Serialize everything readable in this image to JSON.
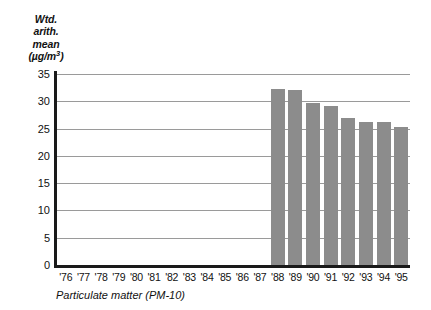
{
  "chart_data": {
    "type": "bar",
    "title": "",
    "subtitle": "",
    "ylabel_lines": [
      "Wtd.",
      "arith.",
      "mean"
    ],
    "ylabel_unit_prefix": "(µg/m",
    "ylabel_unit_exponent": "3",
    "ylabel_unit_suffix": ")",
    "ylabel_full": "Wtd. arith. mean (µg/m3)",
    "xlabel": "",
    "caption": "Particulate matter (PM-10)",
    "categories": [
      "'76",
      "'77",
      "'78",
      "'79",
      "'80",
      "'81",
      "'82",
      "'83",
      "'84",
      "'85",
      "'86",
      "'87",
      "'88",
      "'89",
      "'90",
      "'91",
      "'92",
      "'93",
      "'94",
      "'95"
    ],
    "values": [
      null,
      null,
      null,
      null,
      null,
      null,
      null,
      null,
      null,
      null,
      null,
      null,
      32.3,
      32.1,
      29.7,
      29.2,
      27.0,
      26.2,
      26.2,
      25.2
    ],
    "ylim": [
      0,
      35
    ],
    "yticks": [
      0,
      5,
      10,
      15,
      20,
      25,
      30,
      35
    ],
    "ytick_labels": [
      "0",
      "5",
      "10",
      "15",
      "20",
      "25",
      "30",
      "35"
    ],
    "grid": true,
    "legend": false,
    "bar_color": "#8c8c8c",
    "axis_color": "#1a1a1a",
    "gridline_color": "#9a9a9a",
    "text_color": "#111111",
    "background_color": "#ffffff"
  }
}
